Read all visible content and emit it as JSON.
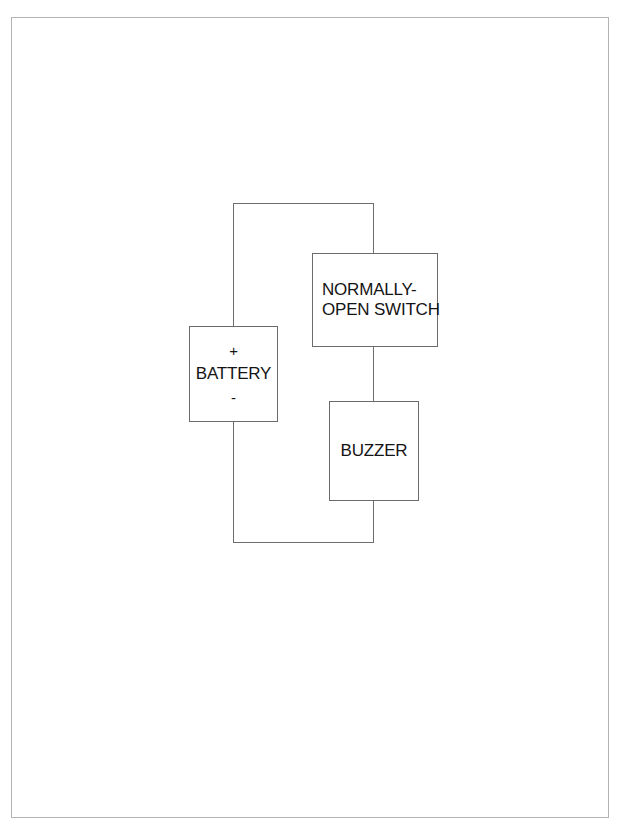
{
  "figure": {
    "caption": "",
    "background_color": "#ffffff",
    "frame_color": "#b4b4b4",
    "wire_color": "#6e6e6e",
    "box_border_color": "#6b6b6b",
    "text_color": "#141414"
  },
  "diagram": {
    "type": "circuit-schematic",
    "title": "",
    "components": [
      {
        "id": "battery",
        "name": "BATTERY",
        "positive_terminal": "+",
        "negative_terminal": "-",
        "label_lines": [
          "+",
          "BATTERY",
          "-"
        ]
      },
      {
        "id": "switch",
        "name": "NORMALLY-OPEN SWITCH",
        "label_lines": [
          "NORMALLY-",
          "OPEN SWITCH"
        ]
      },
      {
        "id": "buzzer",
        "name": "BUZZER",
        "label_lines": [
          "BUZZER"
        ]
      }
    ],
    "connections": [
      {
        "from": "battery",
        "to": "switch",
        "path": "top"
      },
      {
        "from": "switch",
        "to": "buzzer",
        "path": "right-vertical"
      },
      {
        "from": "buzzer",
        "to": "battery",
        "path": "bottom"
      }
    ]
  }
}
